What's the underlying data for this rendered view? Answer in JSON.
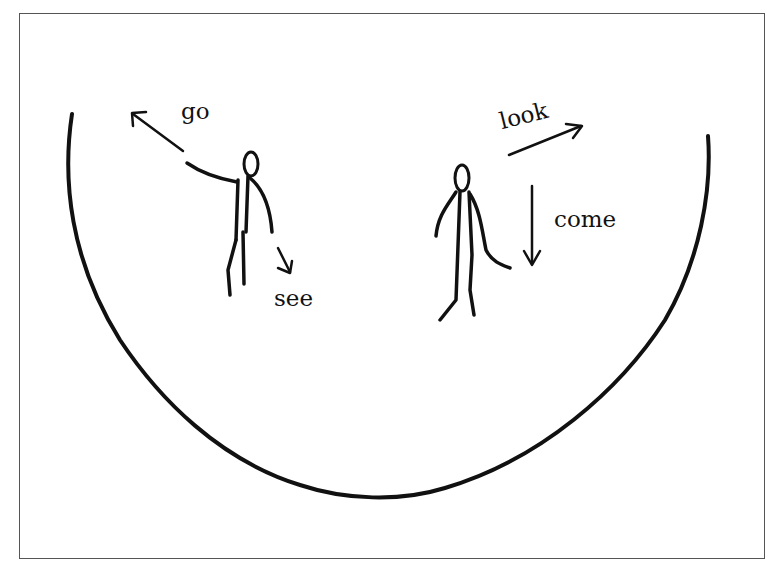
{
  "labels": {
    "go": "go",
    "see": "see",
    "look": "look",
    "come": "come"
  },
  "colors": {
    "ink": "#111111",
    "frame": "#555555"
  }
}
